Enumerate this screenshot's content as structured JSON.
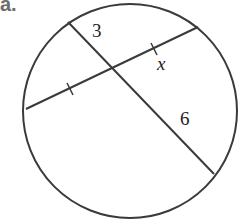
{
  "problem": {
    "part_label": "a."
  },
  "figure": {
    "type": "intersecting-chords-in-circle",
    "colors": {
      "stroke": "#3a3a3a",
      "label": "#222222",
      "part_label": "#6d6d6d",
      "background": "#ffffff"
    },
    "circle": {
      "cx": 130,
      "cy": 111,
      "r": 107
    },
    "chords": [
      {
        "name": "chord-1",
        "from": [
          26,
          109
        ],
        "to": [
          198,
          27
        ],
        "tick_marks": [
          [
            70,
            89
          ],
          [
            154,
            49
          ]
        ]
      },
      {
        "name": "chord-2",
        "from": [
          68,
          22
        ],
        "to": [
          214,
          174
        ]
      }
    ],
    "intersection": [
      111,
      68
    ],
    "labels": {
      "segment_top": "3",
      "segment_bottom": "6",
      "variable": "x"
    }
  }
}
